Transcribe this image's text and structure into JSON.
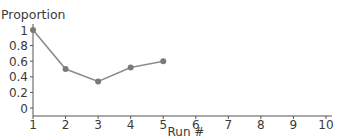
{
  "chart_data": {
    "type": "line",
    "title": "",
    "xlabel": "Run #",
    "ylabel": "Proportion",
    "x": [
      1,
      2,
      3,
      4,
      5
    ],
    "series": [
      {
        "name": "Proportion",
        "values": [
          1.0,
          0.5,
          0.34,
          0.52,
          0.6
        ]
      }
    ],
    "xticks": [
      "1",
      "2",
      "3",
      "4",
      "5",
      "6",
      "7",
      "8",
      "9",
      "10"
    ],
    "yticks": [
      "0",
      "0.2",
      "0.4",
      "0.6",
      "0.8",
      "1"
    ],
    "xlim": [
      1,
      10
    ],
    "ylim": [
      0,
      1
    ],
    "grid": false,
    "legend": null,
    "colors": {
      "line": "#8c8c8c",
      "marker": "#7a7a7a",
      "axis": "#555555",
      "text": "#3a3a3a"
    }
  }
}
